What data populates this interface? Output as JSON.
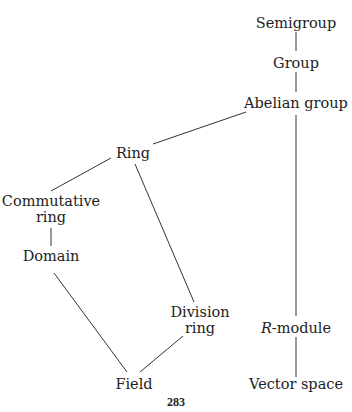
{
  "diagram": {
    "nodes": {
      "semigroup": "Semigroup",
      "group": "Group",
      "abelian_group": "Abelian group",
      "ring": "Ring",
      "commutative_ring_line1": "Commutative",
      "commutative_ring_line2": "ring",
      "domain": "Domain",
      "division_ring_line1": "Division",
      "division_ring_line2": "ring",
      "r_module_italic": "R",
      "r_module_rest": "-module",
      "field": "Field",
      "vector_space": "Vector space"
    },
    "edges": [
      [
        "semigroup",
        "group"
      ],
      [
        "group",
        "abelian_group"
      ],
      [
        "abelian_group",
        "ring"
      ],
      [
        "abelian_group",
        "r_module"
      ],
      [
        "ring",
        "commutative_ring"
      ],
      [
        "ring",
        "division_ring"
      ],
      [
        "commutative_ring",
        "domain"
      ],
      [
        "domain",
        "field"
      ],
      [
        "division_ring",
        "field"
      ],
      [
        "r_module",
        "vector_space"
      ]
    ]
  },
  "page_number": "283",
  "colors": {
    "ink": "#222222",
    "background": "#ffffff"
  }
}
